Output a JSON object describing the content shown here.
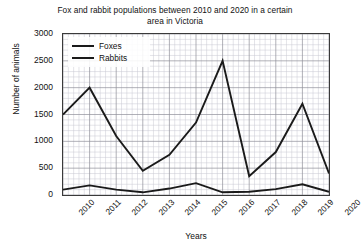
{
  "chart_data": {
    "type": "line",
    "title": "Fox and rabbit populations between 2010 and 2020 in a certain area in Victoria",
    "title_line1": "Fox and rabbit populations between 2010 and 2020 in a",
    "title_line2": "certain area in Victoria",
    "xlabel": "Years",
    "ylabel": "Number of animals",
    "x": [
      2010,
      2011,
      2012,
      2013,
      2014,
      2015,
      2016,
      2017,
      2018,
      2019,
      2020
    ],
    "categories": [
      "2010",
      "2011",
      "2012",
      "2013",
      "2014",
      "2015",
      "2016",
      "2017",
      "2018",
      "2019",
      "2020"
    ],
    "xlim": [
      2010,
      2020
    ],
    "ylim": [
      0,
      3000
    ],
    "ytick_labels": [
      "0",
      "500",
      "1000",
      "1500",
      "2000",
      "2500",
      "3000"
    ],
    "ytick_values": [
      0,
      500,
      1000,
      1500,
      2000,
      2500,
      3000
    ],
    "ytick_step": 500,
    "grid": true,
    "grid_major_color": "#8f8f9a",
    "grid_minor_color": "#c9c9d2",
    "grid_minor_divisions_x": 5,
    "grid_minor_divisions_y": 5,
    "legend_position": "upper left (inside axes)",
    "series": [
      {
        "name": "Foxes",
        "color": "#1a1a1a",
        "values": [
          100,
          180,
          100,
          50,
          120,
          220,
          50,
          60,
          110,
          200,
          60
        ]
      },
      {
        "name": "Rabbits",
        "color": "#1a1a1a",
        "values": [
          1500,
          2000,
          1100,
          450,
          750,
          1350,
          2500,
          350,
          800,
          1700,
          400
        ]
      }
    ]
  },
  "legend": {
    "items": [
      {
        "label": "Foxes"
      },
      {
        "label": "Rabbits"
      }
    ]
  }
}
